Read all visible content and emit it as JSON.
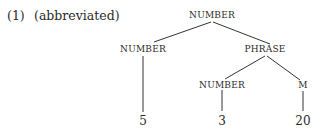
{
  "example": {
    "number": "(1)",
    "note": "(abbreviated)"
  },
  "tree": {
    "root": "NUMBER",
    "left_child": "NUMBER",
    "right_child": "PHRASE",
    "phrase_left": "NUMBER",
    "phrase_right": "M",
    "leaf_left": "5",
    "leaf_mid": "3",
    "leaf_right": "20"
  }
}
